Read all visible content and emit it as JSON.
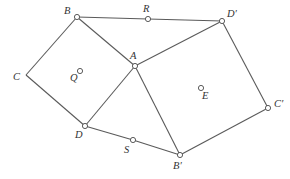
{
  "diagram": {
    "type": "geometry",
    "points": {
      "B": {
        "label": "B",
        "x": 77,
        "y": 17,
        "marker": true,
        "lx": 64,
        "ly": 14
      },
      "R": {
        "label": "R",
        "x": 148,
        "y": 19,
        "marker": true,
        "lx": 143,
        "ly": 12
      },
      "Dp": {
        "label": "D′",
        "x": 222,
        "y": 21,
        "marker": true,
        "lx": 227,
        "ly": 17
      },
      "A": {
        "label": "A",
        "x": 135,
        "y": 66,
        "marker": true,
        "lx": 130,
        "ly": 59
      },
      "C": {
        "label": "C",
        "x": 26,
        "y": 75,
        "marker": false,
        "lx": 13,
        "ly": 80
      },
      "Q": {
        "label": "Q",
        "x": 80,
        "y": 71,
        "marker": true,
        "lx": 70,
        "ly": 81
      },
      "E": {
        "label": "E",
        "x": 201,
        "y": 88,
        "marker": true,
        "lx": 202,
        "ly": 99
      },
      "Cp": {
        "label": "C′",
        "x": 268,
        "y": 108,
        "marker": true,
        "lx": 274,
        "ly": 107
      },
      "D": {
        "label": "D",
        "x": 85,
        "y": 126,
        "marker": true,
        "lx": 75,
        "ly": 138
      },
      "S": {
        "label": "S",
        "x": 133,
        "y": 140,
        "marker": true,
        "lx": 124,
        "ly": 153
      },
      "Bp": {
        "label": "B′",
        "x": 180,
        "y": 155,
        "marker": true,
        "lx": 173,
        "ly": 169
      }
    },
    "segments": [
      [
        "B",
        "R"
      ],
      [
        "R",
        "Dp"
      ],
      [
        "B",
        "A"
      ],
      [
        "B",
        "C"
      ],
      [
        "C",
        "D"
      ],
      [
        "D",
        "A"
      ],
      [
        "A",
        "Dp"
      ],
      [
        "A",
        "Bp"
      ],
      [
        "Dp",
        "Cp"
      ],
      [
        "Cp",
        "Bp"
      ],
      [
        "D",
        "S"
      ],
      [
        "S",
        "Bp"
      ]
    ]
  }
}
